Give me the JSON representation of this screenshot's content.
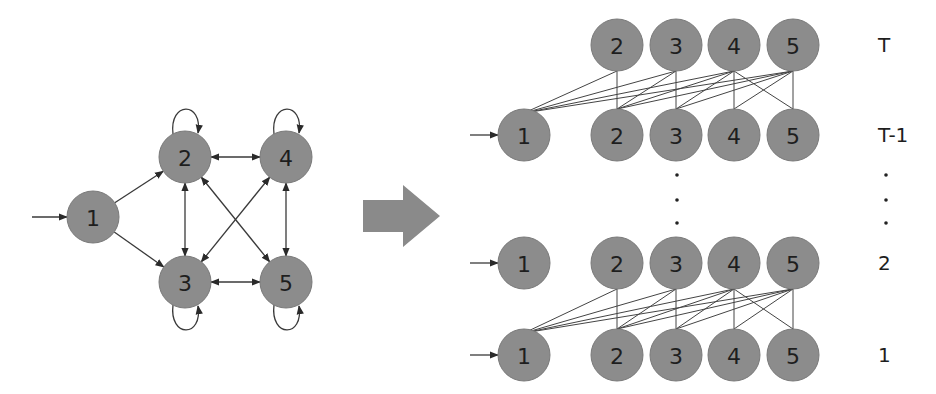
{
  "left_graph": {
    "title": "state transition graph",
    "nodes": [
      {
        "id": "1",
        "label": "1",
        "x": 93,
        "y": 217
      },
      {
        "id": "2",
        "label": "2",
        "x": 185,
        "y": 157
      },
      {
        "id": "3",
        "label": "3",
        "x": 185,
        "y": 282
      },
      {
        "id": "4",
        "label": "4",
        "x": 286,
        "y": 157
      },
      {
        "id": "5",
        "label": "5",
        "x": 286,
        "y": 282
      }
    ],
    "start_arrow_into": "1",
    "directed_edges": [
      [
        "1",
        "2"
      ],
      [
        "1",
        "3"
      ]
    ],
    "bidirectional_edges": [
      [
        "2",
        "4"
      ],
      [
        "2",
        "3"
      ],
      [
        "4",
        "5"
      ],
      [
        "3",
        "5"
      ],
      [
        "2",
        "5"
      ],
      [
        "4",
        "3"
      ]
    ],
    "self_loops": [
      "2",
      "4",
      "3",
      "5"
    ]
  },
  "transform_arrow": {
    "color": "#8a8a8a"
  },
  "right_graph": {
    "title": "time-unrolled lattice",
    "rows": [
      {
        "label": "T",
        "y": 45,
        "nodes": [
          "2",
          "3",
          "4",
          "5"
        ],
        "start_arrow": false
      },
      {
        "label": "T-1",
        "y": 135,
        "nodes": [
          "1",
          "2",
          "3",
          "4",
          "5"
        ],
        "start_arrow": true
      },
      {
        "label": "2",
        "y": 263,
        "nodes": [
          "1",
          "2",
          "3",
          "4",
          "5"
        ],
        "start_arrow": true
      },
      {
        "label": "1",
        "y": 355,
        "nodes": [
          "1",
          "2",
          "3",
          "4",
          "5"
        ],
        "start_arrow": true
      }
    ],
    "ellipsis_label": "⋮",
    "node_x": {
      "1": 524,
      "2": 617,
      "3": 676,
      "4": 734,
      "5": 793
    },
    "row_label_x": 878,
    "transitions_upper_from_T_to_Tminus1": [
      [
        "2",
        "1"
      ],
      [
        "2",
        "2"
      ],
      [
        "3",
        "1"
      ],
      [
        "3",
        "2"
      ],
      [
        "3",
        "3"
      ],
      [
        "4",
        "1"
      ],
      [
        "4",
        "2"
      ],
      [
        "4",
        "3"
      ],
      [
        "4",
        "4"
      ],
      [
        "4",
        "5"
      ],
      [
        "5",
        "1"
      ],
      [
        "5",
        "2"
      ],
      [
        "5",
        "3"
      ],
      [
        "5",
        "4"
      ],
      [
        "5",
        "5"
      ]
    ]
  },
  "colors": {
    "node_fill": "#8c8c8c",
    "edge": "#3a3a3a",
    "background": "#ffffff"
  }
}
